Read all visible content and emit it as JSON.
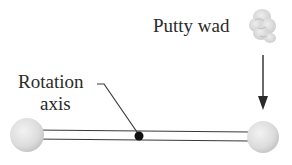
{
  "diagram": {
    "labels": {
      "rotation_line1": "Rotation",
      "rotation_line2": "axis",
      "putty": "Putty wad"
    },
    "elements": {
      "left_ball": "sphere",
      "right_ball": "sphere",
      "rod": "rigid-rod",
      "pivot": "rotation-axis-point",
      "putty_wad": "putty-blob",
      "arrow": "down-arrow-icon"
    },
    "colors": {
      "text": "#2a2a2a",
      "line": "#3a3a3a",
      "ball_fill": "#e4e4e4",
      "ball_shade": "#c6c6c6",
      "putty": "#d9d9d9",
      "pivot": "#111111",
      "background": "#ffffff"
    }
  }
}
